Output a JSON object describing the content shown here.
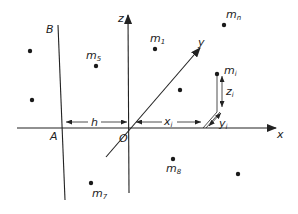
{
  "diagram": {
    "type": "coordinate-system-with-point-masses",
    "colors": {
      "ink": "#222222",
      "background": "#ffffff"
    },
    "axes": {
      "x": {
        "label": "x"
      },
      "y": {
        "label": "y"
      },
      "z": {
        "label": "z"
      }
    },
    "points": {
      "origin": "O",
      "A": "A",
      "B": "B"
    },
    "dimensions": {
      "h": "h",
      "x_i": "x",
      "x_i_sub": "i",
      "y_i": "y",
      "y_i_sub": "i",
      "z_i": "z",
      "z_i_sub": "i"
    },
    "masses": [
      {
        "id": "m1",
        "base": "m",
        "sub": "1"
      },
      {
        "id": "m5",
        "base": "m",
        "sub": "5"
      },
      {
        "id": "mn",
        "base": "m",
        "sub": "n"
      },
      {
        "id": "mi",
        "base": "m",
        "sub": "i"
      },
      {
        "id": "m7",
        "base": "m",
        "sub": "7"
      },
      {
        "id": "m8",
        "base": "m",
        "sub": "8"
      }
    ]
  }
}
